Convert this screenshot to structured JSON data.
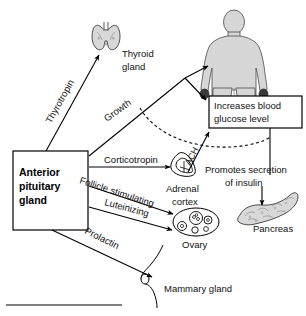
{
  "diagram": {
    "source_box": {
      "label_line1": "Anterior",
      "label_line2": "pituitary",
      "label_line3": "gland"
    },
    "effect_box": {
      "label_line1": "Increases blood",
      "label_line2": "glucose level"
    },
    "insulin_note": {
      "label_line1": "Promotes secretion",
      "label_line2": "of insulin"
    },
    "hormones": [
      {
        "name": "Thyrotropin",
        "target": "Thyroid gland"
      },
      {
        "name": "Growth",
        "target": "Body / Increases blood glucose level"
      },
      {
        "name": "Corticotropin",
        "target": "Adrenal cortex"
      },
      {
        "name": "Follicle stimulating",
        "target": "Ovary"
      },
      {
        "name": "Luteinizing",
        "target": "Ovary"
      },
      {
        "name": "Prolactin",
        "target": "Mammary gland"
      }
    ],
    "secondary_hormones": [
      {
        "name": "ACH",
        "from": "Adrenal cortex",
        "to": "Increases blood glucose level"
      }
    ],
    "targets": [
      {
        "label_line1": "Thyroid",
        "label_line2": "gland",
        "icon": "thyroid-gland-icon"
      },
      {
        "label_line1": "Adrenal",
        "label_line2": "cortex",
        "icon": "adrenal-cortex-icon"
      },
      {
        "label_line1": "Ovary",
        "label_line2": "",
        "icon": "ovary-icon"
      },
      {
        "label_line1": "Pancreas",
        "label_line2": "",
        "icon": "pancreas-icon"
      },
      {
        "label_line1": "Mammary gland",
        "label_line2": "",
        "icon": "mammary-gland-icon"
      },
      {
        "label_line1": "",
        "label_line2": "",
        "icon": "human-body-icon"
      }
    ],
    "colors": {
      "line": "#000000",
      "organ_fill": "#d8d8d8",
      "body_fill": "#d6d6d6",
      "background": "#ffffff"
    }
  }
}
